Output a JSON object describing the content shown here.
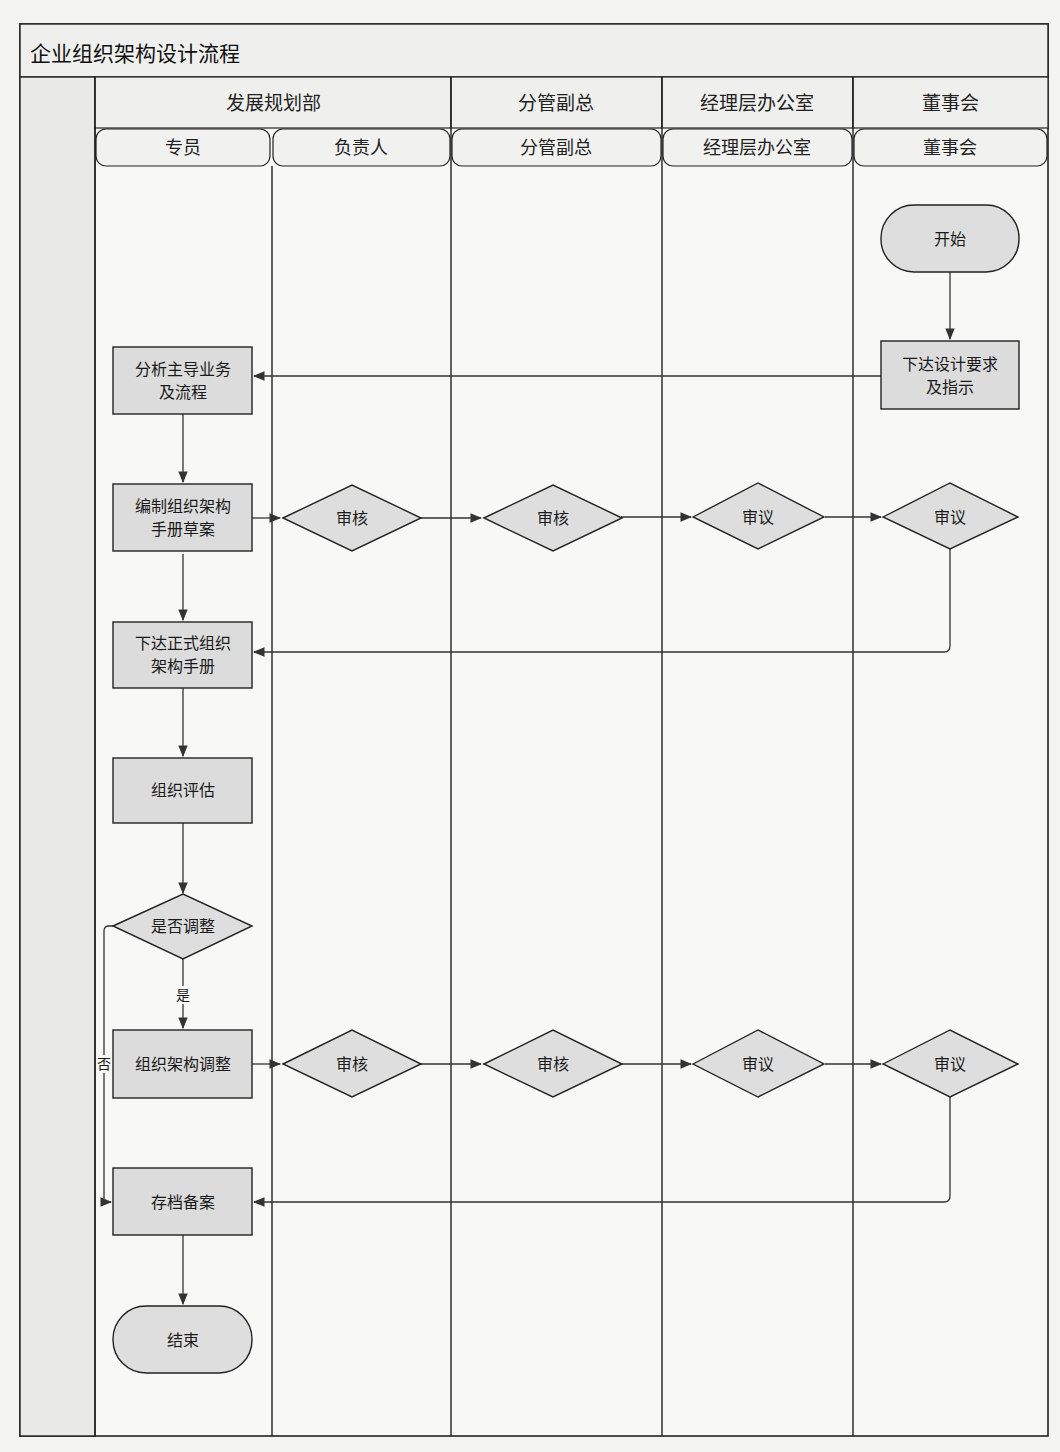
{
  "title": "企业组织架构设计流程",
  "lanes": [
    {
      "name": "发展规划部",
      "roles": [
        "专员",
        "负责人"
      ]
    },
    {
      "name": "分管副总",
      "roles": [
        "分管副总"
      ]
    },
    {
      "name": "经理层办公室",
      "roles": [
        "经理层办公室"
      ]
    },
    {
      "name": "董事会",
      "roles": [
        "董事会"
      ]
    }
  ],
  "nodes": {
    "start": "开始",
    "issue_requirements": [
      "下达设计要求",
      "及指示"
    ],
    "analyze_business": [
      "分析主导业务",
      "及流程"
    ],
    "draft_manual": [
      "编制组织架构",
      "手册草案"
    ],
    "review1_head": "审核",
    "review1_vp": "审核",
    "deliberate1_office": "审议",
    "deliberate1_board": "审议",
    "issue_formal_manual": [
      "下达正式组织",
      "架构手册"
    ],
    "evaluate": "组织评估",
    "need_adjust": "是否调整",
    "adjust": "组织架构调整",
    "review2_head": "审核",
    "review2_vp": "审核",
    "deliberate2_office": "审议",
    "deliberate2_board": "审议",
    "archive": "存档备案",
    "end": "结束"
  },
  "edge_labels": {
    "yes": "是",
    "no": "否"
  },
  "colors": {
    "line": "#222222",
    "node_fill": "#dcdcdc",
    "background": "#f8f8f6"
  }
}
